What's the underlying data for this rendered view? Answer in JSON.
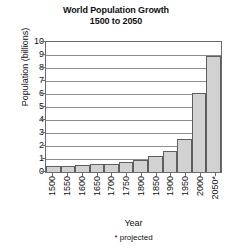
{
  "chart_data": {
    "type": "bar",
    "title": "World Population Growth",
    "subtitle": "1500 to 2050",
    "xlabel": "Year",
    "ylabel": "Population (billions)",
    "categories": [
      "1500",
      "1550",
      "1600",
      "1650",
      "1700",
      "1750",
      "1800",
      "1850",
      "1900",
      "1950",
      "2000",
      "2050*"
    ],
    "values": [
      0.45,
      0.5,
      0.55,
      0.6,
      0.65,
      0.8,
      0.95,
      1.2,
      1.6,
      2.55,
      6.1,
      8.9
    ],
    "ylim": [
      0,
      10
    ],
    "yticks": [
      "10",
      "9",
      "8",
      "7",
      "6",
      "5",
      "4",
      "3",
      "2",
      "1",
      "0"
    ],
    "ytick_values": [
      10,
      9,
      8,
      7,
      6,
      5,
      4,
      3,
      2,
      1,
      0
    ],
    "grid": true,
    "legend": "none",
    "footnote": "* projected",
    "colors": {
      "bar_fill": "#d2d2d2",
      "bar_border": "#5e5e5e",
      "gridline": "#8c8c8c",
      "frame": "#6b6b6b",
      "text": "#111111",
      "background": "#ffffff"
    }
  }
}
